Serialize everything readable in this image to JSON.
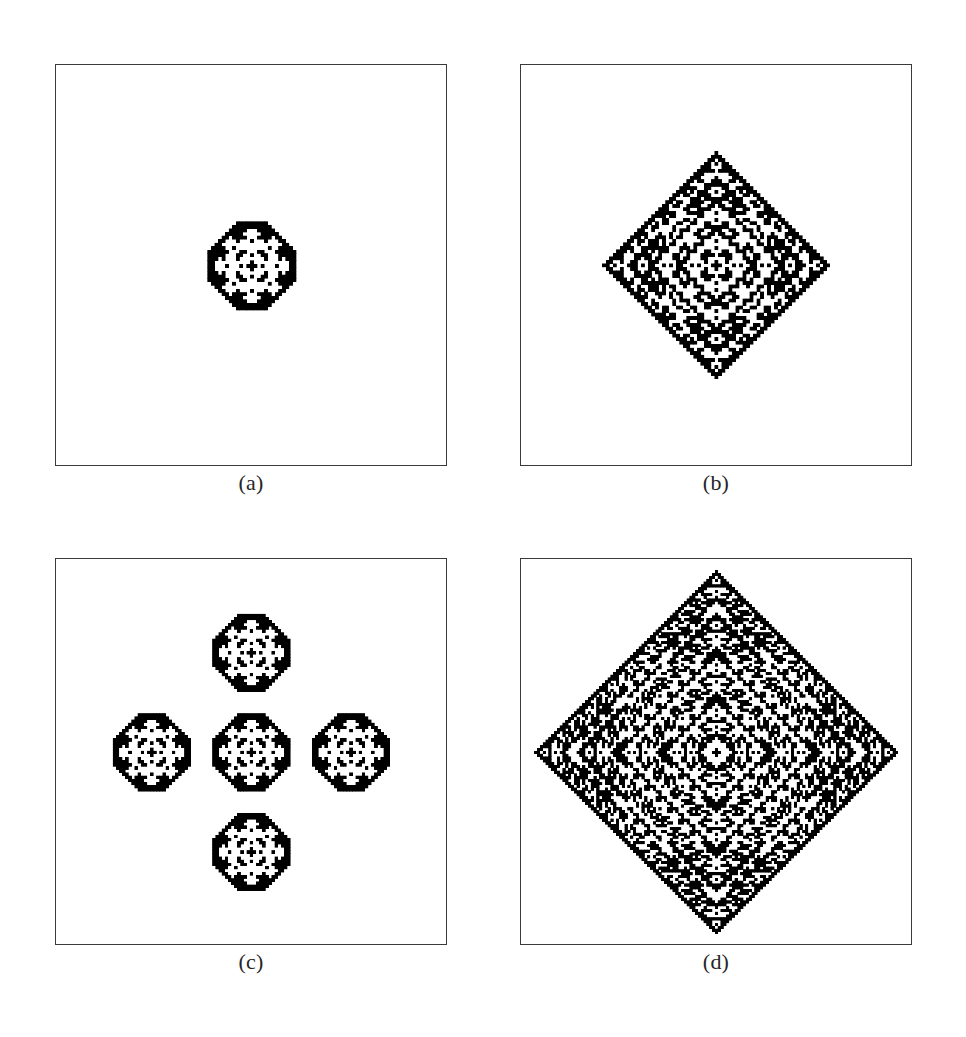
{
  "figure": {
    "background_color": "#ffffff",
    "ink_color": "#000000",
    "frame_color": "#3a3a3a",
    "width": 966,
    "height": 1037
  },
  "chart_data": {
    "type": "heatmap",
    "xlabel": "",
    "ylabel": "",
    "grid": false,
    "legend": null,
    "colormap": [
      "#ffffff",
      "#000000"
    ],
    "panels": [
      {
        "id": "a",
        "label": "(a)",
        "generation": 32,
        "grid_size": 129,
        "pattern_extent_cells": 33,
        "pattern_shape": "octagon",
        "fill_fraction": 0.72,
        "seed": "single center cell",
        "occupied_cells_estimate": 620,
        "panel_fraction_of_frame": 0.29
      },
      {
        "id": "b",
        "label": "(b)",
        "generation": 64,
        "grid_size": 129,
        "pattern_extent_cells": 65,
        "pattern_shape": "diamond",
        "fill_fraction": 0.52,
        "seed": "single center cell",
        "occupied_cells_estimate": 2150,
        "panel_fraction_of_frame": 0.57
      },
      {
        "id": "c",
        "label": "(c)",
        "generation": 96,
        "grid_size": 129,
        "pattern_extent_cells": 99,
        "pattern_shape": "plus / five-lobed cross of octagonal clusters",
        "fill_fraction": 0.4,
        "seed": "single center cell",
        "occupied_cells_estimate": 3100,
        "panel_fraction_of_frame": 0.72
      },
      {
        "id": "d",
        "label": "(d)",
        "generation": 128,
        "grid_size": 129,
        "pattern_extent_cells": 129,
        "pattern_shape": "diamond",
        "fill_fraction": 0.47,
        "seed": "single center cell",
        "occupied_cells_estimate": 7900,
        "panel_fraction_of_frame": 0.92
      }
    ]
  },
  "panels": [
    {
      "id": "a",
      "name": "panel-a",
      "caption": "(a)",
      "canvas_name": "pattern-canvas-a",
      "render": {
        "rule": "sierpinski-xor-diamond",
        "radius": 16,
        "shape": "octagon",
        "cell_px": 3.4,
        "detail": 3,
        "invert_rings": true
      }
    },
    {
      "id": "b",
      "name": "panel-b",
      "caption": "(b)",
      "canvas_name": "pattern-canvas-b",
      "render": {
        "rule": "sierpinski-xor-diamond",
        "radius": 32,
        "shape": "diamond",
        "cell_px": 3.4,
        "detail": 4,
        "invert_rings": true
      }
    },
    {
      "id": "c",
      "name": "panel-c",
      "caption": "(c)",
      "canvas_name": "pattern-canvas-c",
      "render": {
        "rule": "sierpinski-xor-diamond",
        "radius": 16,
        "shape": "cross",
        "cell_px": 3.0,
        "detail": 3,
        "invert_rings": true,
        "lobe_offset": 33
      }
    },
    {
      "id": "d",
      "name": "panel-d",
      "caption": "(d)",
      "canvas_name": "pattern-canvas-d",
      "render": {
        "rule": "sierpinski-xor-diamond",
        "radius": 64,
        "shape": "diamond",
        "cell_px": 2.7,
        "detail": 5,
        "invert_rings": true
      }
    }
  ]
}
